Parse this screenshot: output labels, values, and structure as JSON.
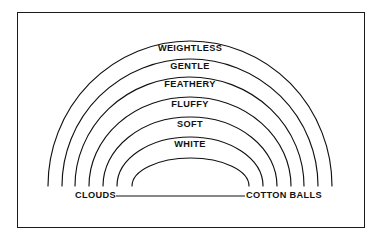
{
  "diagram": {
    "type": "concentric-arc-spectrum",
    "title_text": "",
    "background_color": "#ffffff",
    "line_color": "#111111",
    "border_color": "#1a1a1a",
    "bands": [
      {
        "label": "WEIGHTLESS",
        "index": 0,
        "apex_y": 44,
        "text_center_x": 190
      },
      {
        "label": "GENTLE",
        "index": 1,
        "apex_y": 62,
        "text_center_x": 190
      },
      {
        "label": "FEATHERY",
        "index": 2,
        "apex_y": 80,
        "text_center_x": 190
      },
      {
        "label": "FLUFFY",
        "index": 3,
        "apex_y": 100,
        "text_center_x": 190
      },
      {
        "label": "SOFT",
        "index": 4,
        "apex_y": 120,
        "text_center_x": 190
      },
      {
        "label": "WHITE",
        "index": 5,
        "apex_y": 140,
        "text_center_x": 190
      }
    ],
    "endpoints": {
      "left_label": "CLOUDS",
      "right_label": "COTTON BALLS"
    },
    "baseline": {
      "y": 196,
      "x_start": 116,
      "x_end": 245
    },
    "arcs": [
      {
        "left_x": 48,
        "right_x": 332,
        "apex_y": 41
      },
      {
        "left_x": 62,
        "right_x": 318,
        "apex_y": 59
      },
      {
        "left_x": 75,
        "right_x": 304,
        "apex_y": 77
      },
      {
        "left_x": 89,
        "right_x": 291,
        "apex_y": 97
      },
      {
        "left_x": 103,
        "right_x": 277,
        "apex_y": 117
      },
      {
        "left_x": 117,
        "right_x": 263,
        "apex_y": 137
      },
      {
        "left_x": 132,
        "right_x": 249,
        "apex_y": 158
      }
    ],
    "arc_base_y": 186
  }
}
